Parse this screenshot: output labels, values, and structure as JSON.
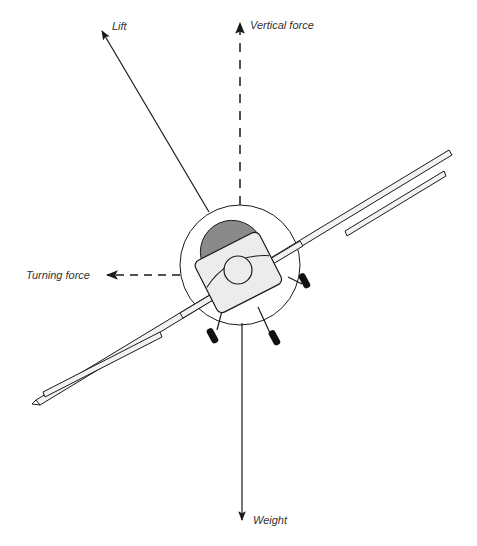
{
  "diagram": {
    "labels": {
      "lift": "Lift",
      "vertical_force": "Vertical force",
      "turning_force": "Turning force",
      "weight": "Weight"
    },
    "colors": {
      "line": "#1a1a1a",
      "fuselage_fill": "#ececec",
      "tail_fill": "#8a8a8a",
      "wing_fill": "#f2f2f2",
      "wheel_fill": "#111111",
      "text": "#333333",
      "background": "#ffffff"
    },
    "arrows": [
      {
        "name": "lift",
        "style": "solid",
        "direction": "up-left"
      },
      {
        "name": "vertical_force",
        "style": "dashed",
        "direction": "up"
      },
      {
        "name": "turning_force",
        "style": "dashed",
        "direction": "left"
      },
      {
        "name": "weight",
        "style": "solid",
        "direction": "down"
      }
    ]
  }
}
